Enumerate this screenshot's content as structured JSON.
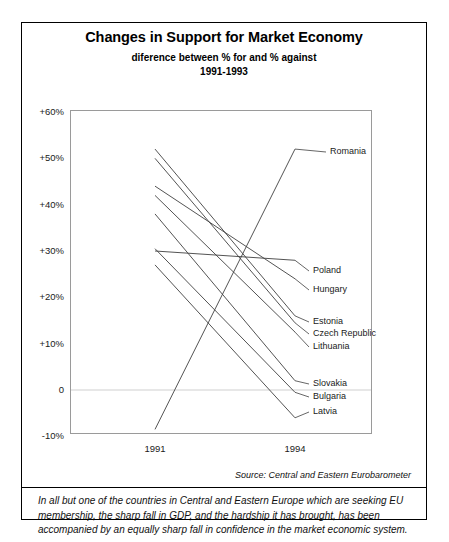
{
  "chart_data": {
    "type": "line",
    "title": "Changes in Support for Market Economy",
    "subtitle": "diference between % for and % against",
    "subtitle2": "1991-1993",
    "xlabel": "",
    "ylabel": "",
    "x": [
      "1991",
      "1994"
    ],
    "xtick_labels": [
      "1991",
      "1994"
    ],
    "ytick_labels": [
      "+60%",
      "+50%",
      "+40%",
      "+30%",
      "+20%",
      "+10%",
      "0",
      "-10%"
    ],
    "ytick_values": [
      60,
      50,
      40,
      30,
      20,
      10,
      0,
      -10
    ],
    "ylim": [
      -12,
      60
    ],
    "grid": false,
    "legend_position": "right-inline-labels",
    "zero_line": true,
    "series": [
      {
        "name": "Romania",
        "values": [
          -8.5,
          52.0
        ]
      },
      {
        "name": "Poland",
        "values": [
          30.0,
          28.0
        ]
      },
      {
        "name": "Hungary",
        "values": [
          44.0,
          24.0
        ]
      },
      {
        "name": "Estonia",
        "values": [
          52.0,
          16.0
        ]
      },
      {
        "name": "Czech Republic",
        "values": [
          50.0,
          14.5
        ]
      },
      {
        "name": "Lithuania",
        "values": [
          42.0,
          12.5
        ]
      },
      {
        "name": "Slovakia",
        "values": [
          38.0,
          2.0
        ]
      },
      {
        "name": "Bulgaria",
        "values": [
          30.5,
          -0.5
        ]
      },
      {
        "name": "Latvia",
        "values": [
          27.0,
          -6.0
        ]
      }
    ],
    "source": "Source: Central and Eastern Eurobarometer",
    "note": "In all but one of the countries in Central and Eastern Europe which are seeking EU membership, the sharp fall in GDP, and the hardship it has brought, has been accompanied by an equally sharp fall in confidence in the market economic system.",
    "colors": {
      "line": "#3f3f3f",
      "frame": "#9a9a9a",
      "text": "#111111",
      "zero_line": "#cfcfcf"
    }
  }
}
